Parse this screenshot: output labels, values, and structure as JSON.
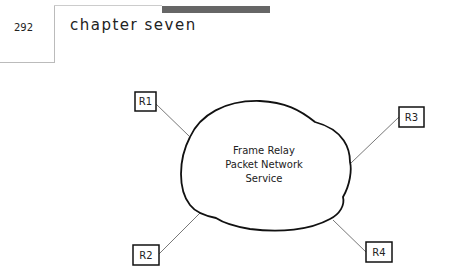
{
  "header": {
    "page_number": "292",
    "chapter_title": "chapter seven"
  },
  "diagram": {
    "cloud": {
      "lines": [
        "Frame Relay",
        "Packet Network",
        "Service"
      ]
    },
    "routers": [
      {
        "id": "r1",
        "label": "R1"
      },
      {
        "id": "r2",
        "label": "R2"
      },
      {
        "id": "r3",
        "label": "R3"
      },
      {
        "id": "r4",
        "label": "R4"
      }
    ]
  }
}
